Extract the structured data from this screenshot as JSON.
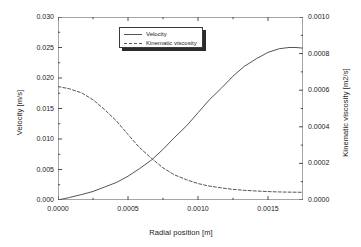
{
  "chart_data": {
    "type": "line",
    "title": "",
    "xlabel": "Radial position [m]",
    "ylabel": "Velocity [m/s]",
    "ylabel_right": "Kinematic viscosity [m2/s]",
    "xlim": [
      0.0,
      0.00175
    ],
    "ylim": [
      0.0,
      0.03
    ],
    "ylim_right": [
      0.0,
      0.001
    ],
    "grid": false,
    "legend_position": "top-center",
    "xticks": [
      "0.0000",
      "0.0005",
      "0.0010",
      "0.0015"
    ],
    "xtick_values": [
      0.0,
      0.0005,
      0.001,
      0.0015
    ],
    "yticks_left": [
      "0.000",
      "0.005",
      "0.010",
      "0.015",
      "0.020",
      "0.025",
      "0.030"
    ],
    "ytick_values_left": [
      0.0,
      0.005,
      0.01,
      0.015,
      0.02,
      0.025,
      0.03
    ],
    "yticks_right": [
      "0.0000",
      "0.0002",
      "0.0004",
      "0.0006",
      "0.0008",
      "0.0010"
    ],
    "ytick_values_right": [
      0.0,
      0.0002,
      0.0004,
      0.0006,
      0.0008,
      0.001
    ],
    "series": [
      {
        "name": "Velocity",
        "axis": "left",
        "style": "solid",
        "color": "#555555",
        "x": [
          0.0,
          8e-05,
          0.00017,
          0.00025,
          0.00033,
          0.00042,
          0.0005,
          0.00058,
          0.00067,
          0.00075,
          0.00083,
          0.00092,
          0.001,
          0.00108,
          0.00117,
          0.00125,
          0.00133,
          0.00142,
          0.0015,
          0.00158,
          0.00165,
          0.0017,
          0.00175
        ],
        "y": [
          0.0,
          0.0004,
          0.0009,
          0.0014,
          0.0021,
          0.0029,
          0.0039,
          0.0051,
          0.0066,
          0.0083,
          0.0102,
          0.0122,
          0.0143,
          0.0164,
          0.0184,
          0.0203,
          0.0219,
          0.0232,
          0.0242,
          0.0248,
          0.025,
          0.025,
          0.0249
        ]
      },
      {
        "name": "Kinematic viscosity",
        "axis": "right",
        "style": "dashed",
        "color": "#555555",
        "x": [
          0.0,
          8e-05,
          0.00017,
          0.00025,
          0.00033,
          0.00042,
          0.0005,
          0.00058,
          0.00067,
          0.00075,
          0.00083,
          0.00092,
          0.001,
          0.00108,
          0.00117,
          0.00125,
          0.00133,
          0.00142,
          0.0015,
          0.00158,
          0.00165,
          0.00175
        ],
        "y": [
          0.00062,
          0.000608,
          0.000585,
          0.000548,
          0.000496,
          0.00043,
          0.000358,
          0.000288,
          0.000226,
          0.000176,
          0.000138,
          0.00011,
          9e-05,
          7.6e-05,
          6.6e-05,
          5.8e-05,
          5.3e-05,
          4.9e-05,
          4.6e-05,
          4.4e-05,
          4.3e-05,
          4.2e-05
        ]
      }
    ],
    "legend": [
      {
        "label": "Velocity",
        "style": "solid"
      },
      {
        "label": "Kinematic viscosity",
        "style": "dashed"
      }
    ]
  }
}
